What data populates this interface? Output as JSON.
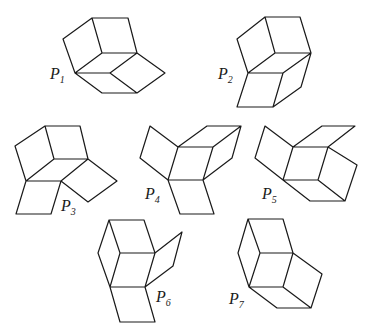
{
  "figures": [
    {
      "id": "P1",
      "label": "P",
      "sub": "1",
      "label_pos": [
        50,
        79
      ]
    },
    {
      "id": "P2",
      "label": "P",
      "sub": "2",
      "label_pos": [
        218,
        79
      ]
    },
    {
      "id": "P3",
      "label": "P",
      "sub": "3",
      "label_pos": [
        61,
        211
      ]
    },
    {
      "id": "P4",
      "label": "P",
      "sub": "4",
      "label_pos": [
        145,
        199
      ]
    },
    {
      "id": "P5",
      "label": "P",
      "sub": "5",
      "label_pos": [
        262,
        199
      ]
    },
    {
      "id": "P6",
      "label": "P",
      "sub": "6",
      "label_pos": [
        156,
        302
      ]
    },
    {
      "id": "P7",
      "label": "P",
      "sub": "7",
      "label_pos": [
        229,
        304
      ]
    }
  ],
  "colors": {
    "stroke": "#1a1a1a",
    "background": "#ffffff"
  }
}
